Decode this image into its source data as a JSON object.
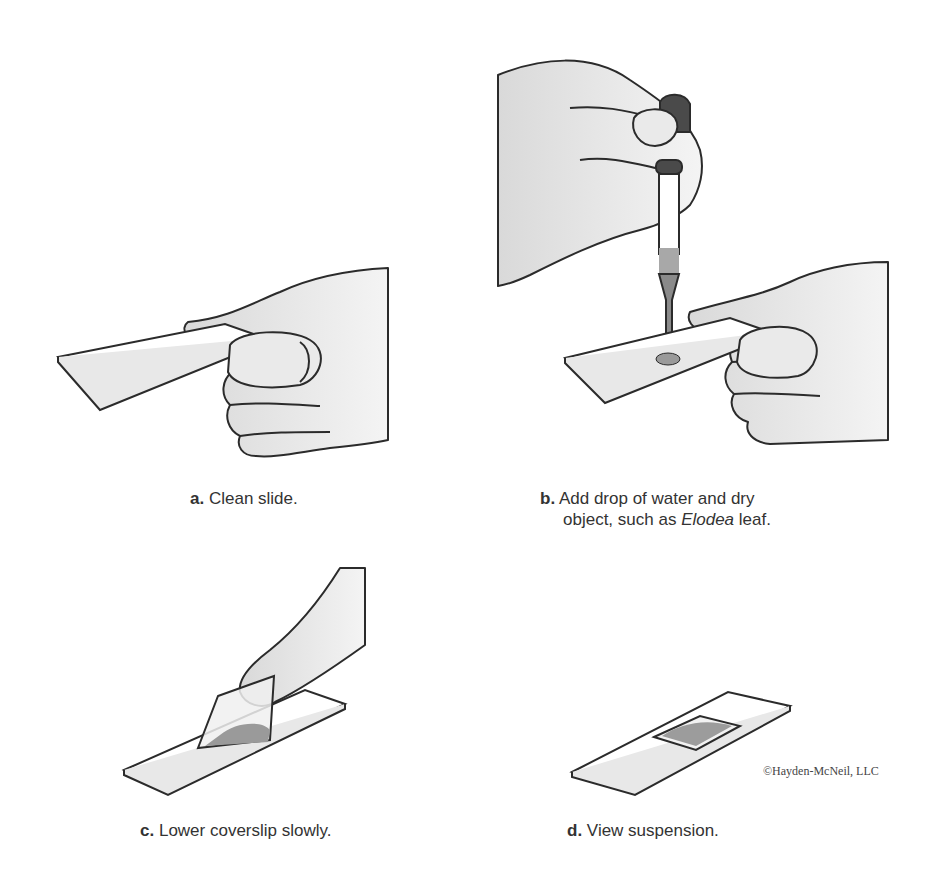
{
  "figure": {
    "panels": [
      {
        "id": "a",
        "letter": "a.",
        "text": "Clean slide."
      },
      {
        "id": "b",
        "letter": "b.",
        "text_line1": "Add drop of water and dry",
        "text_line2_pre": "object, such as ",
        "text_line2_italic": "Elodea",
        "text_line2_post": " leaf."
      },
      {
        "id": "c",
        "letter": "c.",
        "text": "Lower coverslip slowly."
      },
      {
        "id": "d",
        "letter": "d.",
        "text": "View suspension."
      }
    ],
    "copyright": "©Hayden-McNeil, LLC",
    "colors": {
      "outline": "#2b2b2b",
      "skin": "#e4e4e4",
      "shade": "#c8c8c8",
      "liquid": "#9a9a9a",
      "bulb": "#4a4a4a"
    }
  }
}
